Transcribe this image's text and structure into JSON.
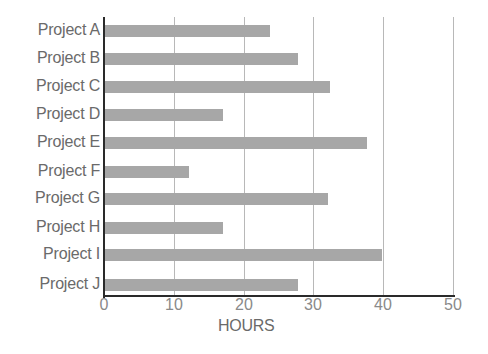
{
  "chart_data": {
    "type": "bar",
    "orientation": "horizontal",
    "title": "",
    "xlabel": "HOURS",
    "ylabel": "",
    "xlim": [
      0,
      50
    ],
    "x_ticks": [
      "0",
      "10",
      "20",
      "30",
      "40",
      "50"
    ],
    "grid": true,
    "legend": null,
    "categories": [
      "Project A",
      "Project B",
      "Project C",
      "Project D",
      "Project E",
      "Project F",
      "Project G",
      "Project H",
      "Project I",
      "Project J"
    ],
    "values": [
      23.7,
      27.7,
      32.3,
      16.9,
      37.6,
      12,
      32,
      16.9,
      39.7,
      27.7
    ],
    "bar_color": "#a7a7a7"
  }
}
